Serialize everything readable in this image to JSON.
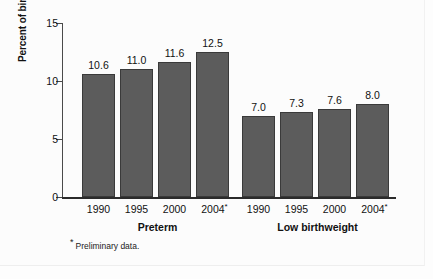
{
  "chart_data": {
    "type": "bar",
    "title": "",
    "subtitle": "",
    "xlabel": "",
    "ylabel": "Percent of births",
    "ylim": [
      0,
      15
    ],
    "yticks": [
      0,
      5,
      10,
      15
    ],
    "ytick_labels": [
      "0",
      "5",
      "10",
      "15"
    ],
    "grid": false,
    "legend": "none",
    "categories": [
      "1990",
      "1995",
      "2000",
      "2004"
    ],
    "groups": [
      {
        "name": "Preterm",
        "label": "Preterm",
        "categories": [
          "1990",
          "1995",
          "2000",
          "2004"
        ],
        "category_labels": [
          "1990",
          "1995",
          "2000",
          "2004"
        ],
        "category_footnote_marks": [
          "",
          "",
          "",
          "*"
        ],
        "values": [
          10.6,
          11.0,
          11.6,
          12.5
        ],
        "value_labels": [
          "10.6",
          "11.0",
          "11.6",
          "12.5"
        ]
      },
      {
        "name": "Low birthweight",
        "label": "Low birthweight",
        "categories": [
          "1990",
          "1995",
          "2000",
          "2004"
        ],
        "category_labels": [
          "1990",
          "1995",
          "2000",
          "2004"
        ],
        "category_footnote_marks": [
          "",
          "",
          "",
          "*"
        ],
        "values": [
          7.0,
          7.3,
          7.6,
          8.0
        ],
        "value_labels": [
          "7.0",
          "7.3",
          "7.6",
          "8.0"
        ]
      }
    ],
    "annotations": [
      {
        "id": "footnote-preliminary",
        "marker": "*",
        "text": "Preliminary data."
      }
    ],
    "colors": {
      "bar_fill": "#5c5c5c",
      "bar_edge": "#3a3a3a",
      "axis": "#2b2b2b",
      "text": "#111111",
      "background": "#fdfdfd"
    }
  },
  "footnote": {
    "marker": "*",
    "text": "Preliminary data."
  }
}
